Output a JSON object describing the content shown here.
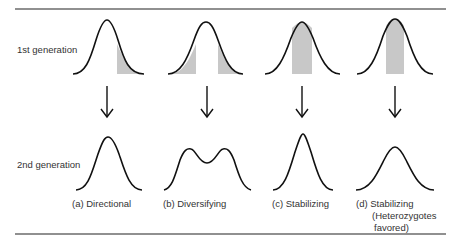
{
  "figure": {
    "row_labels": {
      "first": "1st generation",
      "second": "2nd generation"
    },
    "panels": [
      {
        "id": "a",
        "label": "(a)  Directional",
        "selection": "directional",
        "shaded": "right tail",
        "second_gen_shape": "shifted unimodal"
      },
      {
        "id": "b",
        "label": "(b)  Diversifying",
        "selection": "diversifying",
        "shaded": "both tails",
        "second_gen_shape": "bimodal"
      },
      {
        "id": "c",
        "label": "(c)  Stabilizing",
        "selection": "stabilizing",
        "shaded": "center",
        "second_gen_shape": "narrow unimodal"
      },
      {
        "id": "d",
        "label_lines": [
          "(d)  Stabilizing",
          "(Heterozygotes",
          "favored)"
        ],
        "selection": "stabilizing",
        "shaded": "center",
        "second_gen_shape": "unimodal"
      }
    ],
    "colors": {
      "curve": "#111111",
      "shade": "#c8c8c8",
      "rule": "#222222"
    }
  }
}
